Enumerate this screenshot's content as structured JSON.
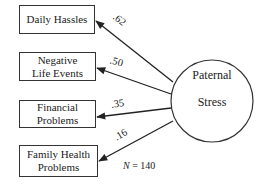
{
  "diagram": {
    "latent": {
      "line1": "Paternal",
      "line2": "Stress"
    },
    "indicators": [
      {
        "line1": "Daily Hassles",
        "line2": "",
        "loading": ".62"
      },
      {
        "line1": "Negative",
        "line2": "Life Events",
        "loading": ".50"
      },
      {
        "line1": "Financial",
        "line2": "Problems",
        "loading": ".35"
      },
      {
        "line1": "Family Health",
        "line2": "Problems",
        "loading": ".16"
      }
    ],
    "sample_size": {
      "italic": "N",
      "rest": " = 140"
    }
  }
}
